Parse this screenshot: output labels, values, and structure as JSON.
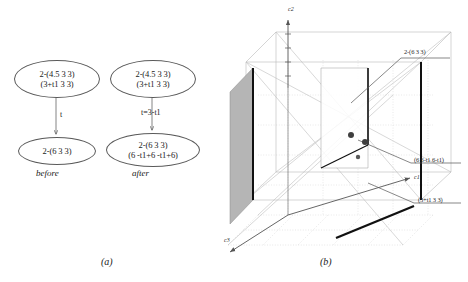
{
  "figure": {
    "panel_a": {
      "caption": "(a)",
      "nodes": [
        {
          "id": "before-top",
          "line1": "2-(4.5 3 3)",
          "line2": "(3+t1  3 3)"
        },
        {
          "id": "after-top",
          "line1": "2-(4.5 3 3)",
          "line2": "(3+t1  3 3)"
        },
        {
          "id": "before-bottom",
          "line1": "2-(6 3 3)",
          "line2": ""
        },
        {
          "id": "after-bottom",
          "line1": "2-(6 3 3)",
          "line2": "(6 -t1+6 -t1+6)"
        }
      ],
      "edge_labels": {
        "left": "t",
        "right": "t=3-t1"
      },
      "sub_captions": {
        "before": "before",
        "after": "after"
      }
    },
    "panel_b": {
      "caption": "(b)",
      "axes": {
        "vertical": "c2",
        "right": "c1",
        "left": "c3"
      },
      "point_labels": [
        {
          "id": "upper",
          "text": "2-(6 3 3)"
        },
        {
          "id": "middle",
          "text": "(6 6-t1 6-t1)"
        },
        {
          "id": "lower",
          "text": "(3+t1 3 3)"
        }
      ]
    },
    "colors": {
      "ink": "#1a1a1a",
      "grid_light": "#c9c9c9",
      "grid_mid": "#9a9a9a",
      "plane_fill": "#b8b8b8",
      "heavy_line": "#111111"
    }
  }
}
